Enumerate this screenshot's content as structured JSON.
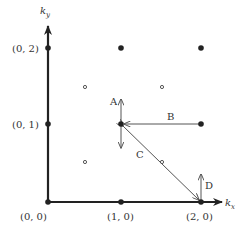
{
  "diagram": {
    "axes": {
      "x_label": "k",
      "x_sub": "x",
      "y_label": "k",
      "y_sub": "y"
    },
    "tick_labels": {
      "origin": "(0, 0)",
      "x1": "(1, 0)",
      "x2": "(2, 0)",
      "y1": "(0, 1)",
      "y2": "(0, 2)"
    },
    "arrow_labels": {
      "A": "A",
      "B": "B",
      "C": "C",
      "D": "D"
    },
    "filled_points": [
      "(0,0)",
      "(1,0)",
      "(2,0)",
      "(0,1)",
      "(1,1)",
      "(2,1)",
      "(0,2)",
      "(1,2)",
      "(2,2)"
    ],
    "open_points": [
      "(0.5,0.5)",
      "(1.5,0.5)",
      "(0.5,1.5)",
      "(1.5,1.5)"
    ],
    "colors": {
      "axis": "#222222",
      "arrow": "#555555",
      "point": "#222222"
    }
  }
}
